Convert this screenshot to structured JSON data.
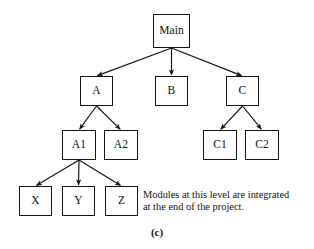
{
  "figure": {
    "caption": "(c)",
    "background_color": "#ffffff",
    "line_color": "#141414",
    "text_color": "#111111"
  },
  "annotation": {
    "name": "integration-note",
    "line1": "Modules at this level are integrated",
    "line2": "at the end of the project.",
    "x": 143,
    "y": 189
  },
  "chart_data": {
    "type": "diagram",
    "subtype": "module-hierarchy-tree",
    "title": "(c)",
    "nodes": [
      {
        "id": "Main",
        "label": "Main",
        "level": 0,
        "x": 153,
        "y": 14,
        "w": 37,
        "h": 34
      },
      {
        "id": "A",
        "label": "A",
        "level": 1,
        "x": 80,
        "y": 76,
        "w": 33,
        "h": 30
      },
      {
        "id": "B",
        "label": "B",
        "level": 1,
        "x": 155,
        "y": 76,
        "w": 33,
        "h": 30
      },
      {
        "id": "C",
        "label": "C",
        "level": 1,
        "x": 226,
        "y": 76,
        "w": 33,
        "h": 30
      },
      {
        "id": "A1",
        "label": "A1",
        "level": 2,
        "x": 62,
        "y": 130,
        "w": 34,
        "h": 30
      },
      {
        "id": "A2",
        "label": "A2",
        "level": 2,
        "x": 104,
        "y": 130,
        "w": 34,
        "h": 30
      },
      {
        "id": "C1",
        "label": "C1",
        "level": 2,
        "x": 203,
        "y": 130,
        "w": 34,
        "h": 30
      },
      {
        "id": "C2",
        "label": "C2",
        "level": 2,
        "x": 245,
        "y": 130,
        "w": 34,
        "h": 30
      },
      {
        "id": "X",
        "label": "X",
        "level": 3,
        "x": 19,
        "y": 186,
        "w": 33,
        "h": 30
      },
      {
        "id": "Y",
        "label": "Y",
        "level": 3,
        "x": 62,
        "y": 186,
        "w": 33,
        "h": 30
      },
      {
        "id": "Z",
        "label": "Z",
        "level": 3,
        "x": 105,
        "y": 186,
        "w": 33,
        "h": 30
      }
    ],
    "edges": [
      {
        "from": "Main",
        "to": "A",
        "arrow": true
      },
      {
        "from": "Main",
        "to": "B",
        "arrow": true
      },
      {
        "from": "Main",
        "to": "C",
        "arrow": true
      },
      {
        "from": "A",
        "to": "A1",
        "arrow": true
      },
      {
        "from": "A",
        "to": "A2",
        "arrow": true
      },
      {
        "from": "C",
        "to": "C1",
        "arrow": true
      },
      {
        "from": "C",
        "to": "C2",
        "arrow": true
      },
      {
        "from": "A1",
        "to": "X",
        "arrow": true
      },
      {
        "from": "A1",
        "to": "Y",
        "arrow": true
      },
      {
        "from": "A1",
        "to": "Z",
        "arrow": true
      }
    ],
    "annotations": [
      "Modules at this level are integrated",
      "at the end of the project."
    ],
    "levels": [
      {
        "index": 0,
        "members": [
          "Main"
        ]
      },
      {
        "index": 1,
        "members": [
          "A",
          "B",
          "C"
        ]
      },
      {
        "index": 2,
        "members": [
          "A1",
          "A2",
          "C1",
          "C2"
        ]
      },
      {
        "index": 3,
        "members": [
          "X",
          "Y",
          "Z"
        ]
      }
    ]
  }
}
